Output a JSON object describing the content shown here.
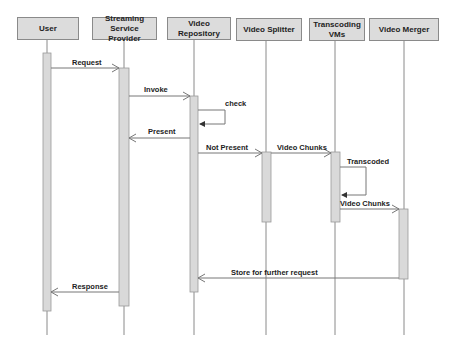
{
  "diagram": {
    "type": "sequence",
    "participants": [
      {
        "id": "user",
        "label": "User"
      },
      {
        "id": "ssp",
        "label": "Streaming Service Provider"
      },
      {
        "id": "repo",
        "label": "Video Repository"
      },
      {
        "id": "splitter",
        "label": "Video Splitter"
      },
      {
        "id": "transcoding",
        "label": "Transcoding VMs"
      },
      {
        "id": "merger",
        "label": "Video Merger"
      }
    ],
    "messages": [
      {
        "from": "user",
        "to": "ssp",
        "label": "Request",
        "kind": "sync"
      },
      {
        "from": "ssp",
        "to": "repo",
        "label": "Invoke",
        "kind": "sync"
      },
      {
        "from": "repo",
        "to": "repo",
        "label": "check",
        "kind": "self"
      },
      {
        "from": "repo",
        "to": "ssp",
        "label": "Present",
        "kind": "return"
      },
      {
        "from": "repo",
        "to": "splitter",
        "label": "Not Present",
        "kind": "sync"
      },
      {
        "from": "splitter",
        "to": "transcoding",
        "label": "Video Chunks",
        "kind": "sync"
      },
      {
        "from": "transcoding",
        "to": "transcoding",
        "label": "Transcoded",
        "kind": "self"
      },
      {
        "from": "transcoding",
        "to": "merger",
        "label": "Video Chunks",
        "kind": "sync"
      },
      {
        "from": "merger",
        "to": "repo",
        "label": "Store for further request",
        "kind": "return"
      },
      {
        "from": "ssp",
        "to": "user",
        "label": "Response",
        "kind": "return"
      }
    ]
  },
  "colors": {
    "box_fill": "#dcdcdc",
    "box_border": "#8a8a8a",
    "activation_fill": "#d9d9d9",
    "line": "#777777",
    "text": "#222222"
  }
}
